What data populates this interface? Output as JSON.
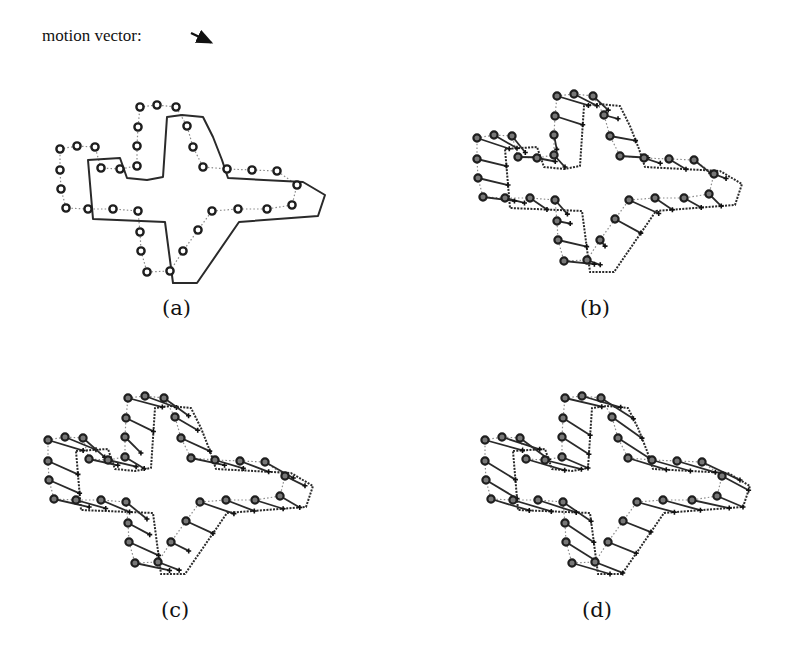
{
  "legend": {
    "label": "motion vector:",
    "arrow": {
      "x1": 191,
      "y1": 33,
      "x2": 214,
      "y2": 44
    }
  },
  "captions": {
    "a": "(a)",
    "b": "(b)",
    "c": "(c)",
    "d": "(d)"
  },
  "panels": [
    {
      "id": "a",
      "offset": [
        0,
        0
      ],
      "vector_scale": 0,
      "show_source_contour": true
    },
    {
      "id": "b",
      "offset": [
        417,
        -11
      ],
      "vector_scale": 0.45
    },
    {
      "id": "c",
      "offset": [
        -12,
        291
      ],
      "vector_scale": 0.75
    },
    {
      "id": "d",
      "offset": [
        425,
        291
      ],
      "vector_scale": 1.0
    }
  ],
  "shape": {
    "sample_points": [
      [
        140,
        107
      ],
      [
        157,
        105
      ],
      [
        176,
        107
      ],
      [
        187,
        126
      ],
      [
        193,
        147
      ],
      [
        203,
        167
      ],
      [
        227,
        169
      ],
      [
        252,
        170
      ],
      [
        277,
        171
      ],
      [
        297,
        185
      ],
      [
        292,
        205
      ],
      [
        267,
        209
      ],
      [
        238,
        209
      ],
      [
        212,
        211
      ],
      [
        198,
        230
      ],
      [
        183,
        251
      ],
      [
        170,
        271
      ],
      [
        147,
        272
      ],
      [
        141,
        251
      ],
      [
        140,
        232
      ],
      [
        138,
        211
      ],
      [
        113,
        209
      ],
      [
        88,
        209
      ],
      [
        66,
        208
      ],
      [
        61,
        189
      ],
      [
        60,
        170
      ],
      [
        60,
        149
      ],
      [
        77,
        146
      ],
      [
        95,
        147
      ],
      [
        101,
        168
      ],
      [
        120,
        169
      ],
      [
        137,
        166
      ],
      [
        137,
        146
      ],
      [
        138,
        127
      ]
    ],
    "target_contour": [
      [
        88,
        160
      ],
      [
        120,
        158
      ],
      [
        127,
        178
      ],
      [
        147,
        180
      ],
      [
        163,
        177
      ],
      [
        167,
        117
      ],
      [
        182,
        115
      ],
      [
        203,
        117
      ],
      [
        213,
        137
      ],
      [
        222,
        160
      ],
      [
        228,
        178
      ],
      [
        303,
        182
      ],
      [
        325,
        195
      ],
      [
        318,
        216
      ],
      [
        239,
        222
      ],
      [
        197,
        283
      ],
      [
        173,
        283
      ],
      [
        165,
        222
      ],
      [
        93,
        219
      ],
      [
        88,
        160
      ]
    ],
    "motion": [
      38,
      18
    ]
  },
  "caption_positions": {
    "a": [
      162,
      296
    ],
    "b": [
      580,
      296
    ],
    "c": [
      161,
      598
    ],
    "d": [
      582,
      598
    ]
  }
}
